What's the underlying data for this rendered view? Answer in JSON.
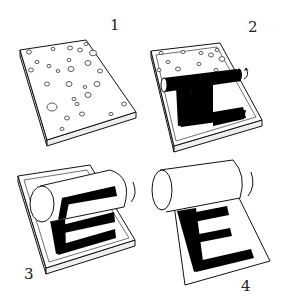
{
  "figure": {
    "steps": [
      {
        "number": "1",
        "label": "Plate with ink droplets"
      },
      {
        "number": "2",
        "label": "Roller inking plate, letter shape appears"
      },
      {
        "number": "3",
        "label": "Roller picks up letter"
      },
      {
        "number": "4",
        "label": "Letter E printed on sheet"
      }
    ],
    "printed_letter": "E",
    "colors": {
      "ink": "#000000",
      "line": "#111111",
      "paper": "#ffffff"
    }
  }
}
